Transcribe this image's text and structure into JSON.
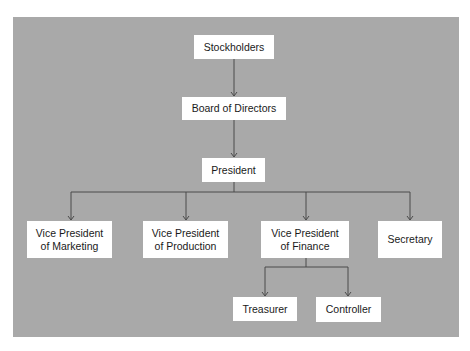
{
  "chart": {
    "type": "organizational-chart",
    "nodes": {
      "stockholders": {
        "label": "Stockholders"
      },
      "board": {
        "label": "Board of Directors"
      },
      "president": {
        "label": "President"
      },
      "vp_marketing": {
        "line1": "Vice President",
        "line2": "of Marketing"
      },
      "vp_production": {
        "line1": "Vice President",
        "line2": "of Production"
      },
      "vp_finance": {
        "line1": "Vice President",
        "line2": "of Finance"
      },
      "secretary": {
        "label": "Secretary"
      },
      "treasurer": {
        "label": "Treasurer"
      },
      "controller": {
        "label": "Controller"
      }
    },
    "edges": [
      [
        "Stockholders",
        "Board of Directors"
      ],
      [
        "Board of Directors",
        "President"
      ],
      [
        "President",
        "Vice President of Marketing"
      ],
      [
        "President",
        "Vice President of Production"
      ],
      [
        "President",
        "Vice President of Finance"
      ],
      [
        "President",
        "Secretary"
      ],
      [
        "Vice President of Finance",
        "Treasurer"
      ],
      [
        "Vice President of Finance",
        "Controller"
      ]
    ]
  },
  "colors": {
    "background": "#a9a9a9",
    "box": "#ffffff",
    "connector": "#4a4a4a",
    "text": "#1a1a1a"
  }
}
